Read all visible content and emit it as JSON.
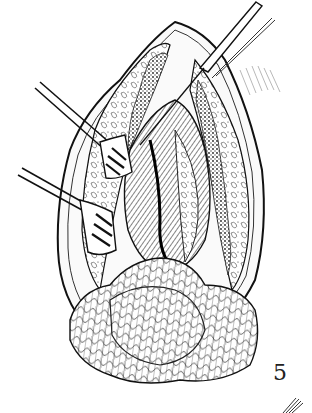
{
  "figure": {
    "number": "5",
    "style": "black-and-white pen-and-ink",
    "colors": {
      "ink": "#111111",
      "paper": "#ffffff",
      "shade": "#555555"
    }
  }
}
